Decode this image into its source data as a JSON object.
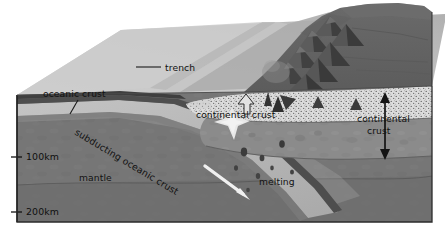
{
  "figure": {
    "labels": {
      "trench": "trench",
      "oceanic_crust": "oceanic crust",
      "subducting_oceanic_crust": "subducting oceanic crust",
      "mantle": "mantle",
      "continental_crust_left": "continental crust",
      "continental_crust_right": "continental crust",
      "melting": "melting"
    },
    "depth_scale": {
      "ticks": [
        {
          "label": "100km",
          "value": 100,
          "unit": "km"
        },
        {
          "label": "200km",
          "value": 200,
          "unit": "km"
        }
      ]
    },
    "features": {
      "volcano_chain": "volcano-chain",
      "magma_bodies": "magma-intrusions",
      "subduction_arrow": "subduction-direction-arrow",
      "thickness_arrow": "continental-crust-thickness-arrow"
    },
    "colors": {
      "background": "#ffffff",
      "ocean_surface": "#c9c9c9",
      "ocean_surface_far": "#b4b4b4",
      "oceanic_crust_dark": "#4c4c4c",
      "lithosphere": "#9a9a9a",
      "mantle": "#757575",
      "mantle_deep": "#6e6e6e",
      "continental_stipple": "#d8d8d8",
      "continental_lower": "#8a8a8a",
      "continent_surface": "#636363",
      "slab_band": "#bdbdbd",
      "magma_dark": "#3a3a3a",
      "arrow_white": "#f2f2f2",
      "outline": "#2a2a2a",
      "text": "#121212"
    }
  }
}
